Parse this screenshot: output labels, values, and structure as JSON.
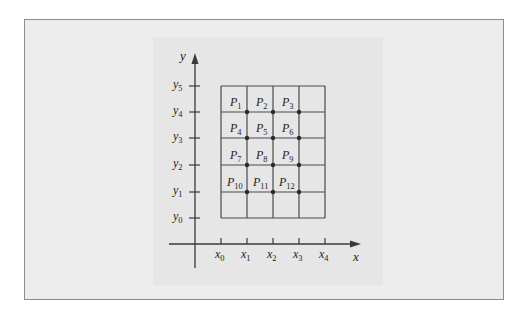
{
  "figure": {
    "axes": {
      "x_label": "x",
      "y_label": "y",
      "x_ticks": [
        {
          "base": "x",
          "sub": "0"
        },
        {
          "base": "x",
          "sub": "1"
        },
        {
          "base": "x",
          "sub": "2"
        },
        {
          "base": "x",
          "sub": "3"
        },
        {
          "base": "x",
          "sub": "4"
        }
      ],
      "y_ticks": [
        {
          "base": "y",
          "sub": "0"
        },
        {
          "base": "y",
          "sub": "1"
        },
        {
          "base": "y",
          "sub": "2"
        },
        {
          "base": "y",
          "sub": "3"
        },
        {
          "base": "y",
          "sub": "4"
        },
        {
          "base": "y",
          "sub": "5"
        }
      ]
    },
    "grid": {
      "columns": 4,
      "rows": 5
    },
    "points": [
      {
        "base": "P",
        "sub": "1",
        "xi": 1,
        "yi": 4
      },
      {
        "base": "P",
        "sub": "2",
        "xi": 2,
        "yi": 4
      },
      {
        "base": "P",
        "sub": "3",
        "xi": 3,
        "yi": 4
      },
      {
        "base": "P",
        "sub": "4",
        "xi": 1,
        "yi": 3
      },
      {
        "base": "P",
        "sub": "5",
        "xi": 2,
        "yi": 3
      },
      {
        "base": "P",
        "sub": "6",
        "xi": 3,
        "yi": 3
      },
      {
        "base": "P",
        "sub": "7",
        "xi": 1,
        "yi": 2
      },
      {
        "base": "P",
        "sub": "8",
        "xi": 2,
        "yi": 2
      },
      {
        "base": "P",
        "sub": "9",
        "xi": 3,
        "yi": 2
      },
      {
        "base": "P",
        "sub": "10",
        "xi": 1,
        "yi": 1
      },
      {
        "base": "P",
        "sub": "11",
        "xi": 2,
        "yi": 1
      },
      {
        "base": "P",
        "sub": "12",
        "xi": 3,
        "yi": 1
      }
    ],
    "colors": {
      "line": "#3a3a3a",
      "grid": "#4a4a4a",
      "frame_fill": "#ececec",
      "frame_border": "#8c8c8c"
    }
  }
}
